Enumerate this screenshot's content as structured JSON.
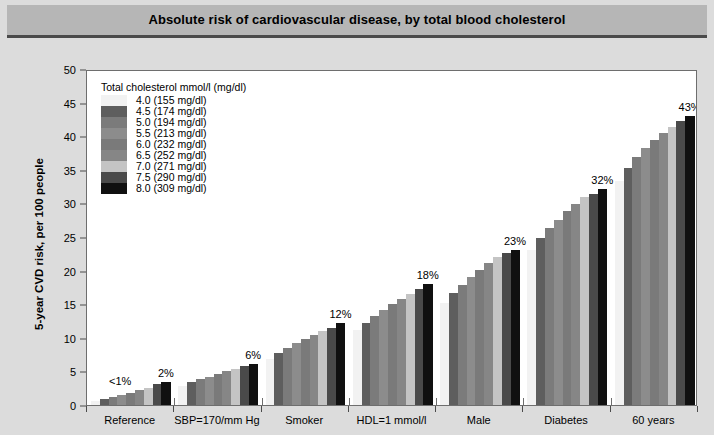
{
  "title": "Absolute risk of cardiovascular disease, by total blood cholesterol",
  "legend": {
    "title": "Total cholesterol mmol/l (mg/dl)",
    "items": [
      {
        "label": "4.0 (155 mg/dl)",
        "color": "#f2f2f2"
      },
      {
        "label": "4.5 (174 mg/dl)",
        "color": "#5e5e5e"
      },
      {
        "label": "5.0 (194 mg/dl)",
        "color": "#7b7b7b"
      },
      {
        "label": "5.5 (213 mg/dl)",
        "color": "#8c8c8c"
      },
      {
        "label": "6.0 (232 mg/dl)",
        "color": "#7a7a7a"
      },
      {
        "label": "6.5 (252 mg/dl)",
        "color": "#868686"
      },
      {
        "label": "7.0 (271 mg/dl)",
        "color": "#c4c4c4"
      },
      {
        "label": "7.5 (290 mg/dl)",
        "color": "#4a4a4a"
      },
      {
        "label": "8.0 (309 mg/dl)",
        "color": "#101010"
      }
    ]
  },
  "axes": {
    "ylabel": "5-year CVD risk, per 100 people",
    "yticks": [
      "0",
      "5",
      "10",
      "15",
      "20",
      "25",
      "30",
      "35",
      "40",
      "45",
      "50"
    ],
    "ylim": [
      0,
      50
    ],
    "xlabel": ""
  },
  "chart_data": {
    "type": "bar",
    "title": "Absolute risk of cardiovascular disease, by total blood cholesterol",
    "xlabel": "",
    "ylabel": "5-year CVD risk, per 100 people",
    "ylim": [
      0,
      50
    ],
    "grid": false,
    "legend_position": "inside-top-left",
    "legend_title": "Total cholesterol mmol/l (mg/dl)",
    "categories": [
      "Reference",
      "SBP=170/mm Hg",
      "Smoker",
      "HDL=1 mmol/l",
      "Male",
      "Diabetes",
      "60 years"
    ],
    "series": [
      {
        "name": "4.0 (155 mg/dl)",
        "values": [
          0.6,
          2.9,
          6.9,
          11.1,
          15.2,
          23.0,
          33.4
        ]
      },
      {
        "name": "4.5 (174 mg/dl)",
        "values": [
          0.9,
          3.4,
          7.8,
          12.2,
          16.6,
          24.8,
          35.3
        ]
      },
      {
        "name": "5.0 (194 mg/dl)",
        "values": [
          1.2,
          3.8,
          8.5,
          13.2,
          17.9,
          26.3,
          36.9
        ]
      },
      {
        "name": "5.5 (213 mg/dl)",
        "values": [
          1.5,
          4.2,
          9.2,
          14.1,
          19.0,
          27.6,
          38.2
        ]
      },
      {
        "name": "6.0 (232 mg/dl)",
        "values": [
          1.8,
          4.6,
          9.8,
          15.0,
          20.1,
          28.8,
          39.4
        ]
      },
      {
        "name": "6.5 (252 mg/dl)",
        "values": [
          2.2,
          5.0,
          10.4,
          15.8,
          21.1,
          29.9,
          40.5
        ]
      },
      {
        "name": "7.0 (271 mg/dl)",
        "values": [
          2.6,
          5.4,
          11.0,
          16.5,
          22.0,
          30.9,
          41.4
        ]
      },
      {
        "name": "7.5 (290 mg/dl)",
        "values": [
          3.1,
          5.8,
          11.5,
          17.3,
          22.6,
          31.4,
          42.3
        ]
      },
      {
        "name": "8.0 (309 mg/dl)",
        "values": [
          3.4,
          6.1,
          12.2,
          18.0,
          23.1,
          32.1,
          43.0
        ]
      }
    ],
    "annotations": [
      {
        "text": "<1%",
        "group": "Reference",
        "align": "left"
      },
      {
        "text": "2%",
        "group": "SBP=170/mm Hg",
        "align": "top"
      },
      {
        "text": "6%",
        "group": "Smoker",
        "align": "top"
      },
      {
        "text": "12%",
        "group": "HDL=1 mmol/l",
        "align": "top"
      },
      {
        "text": "18%",
        "group": "Male",
        "align": "top"
      },
      {
        "text": "23%",
        "group": "Diabetes",
        "align": "top"
      },
      {
        "text": "32%",
        "group": "60 years",
        "align": "top"
      },
      {
        "text": "43%",
        "group": "60 years",
        "align": "top"
      }
    ],
    "value_labels": [
      "<1%",
      "2%",
      "6%",
      "12%",
      "18%",
      "23%",
      "32%",
      "43%"
    ]
  },
  "colors": {
    "page_background": "#dcdcdc",
    "title_background": "#b6b6b6",
    "title_rule": "#4a4a4a",
    "plot_background": "#ffffff",
    "axis": "#6e6e6e",
    "text": "#000000"
  }
}
